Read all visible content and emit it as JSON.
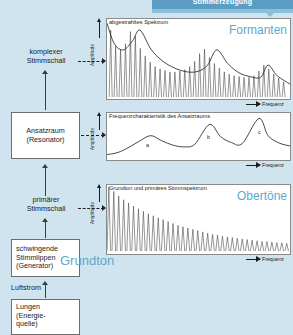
{
  "banner": {
    "title": "Stimmerzeugung"
  },
  "flow": {
    "boxes": [
      {
        "name": "ansatzraum",
        "lines": [
          "Ansatzraum",
          "(Resonator)"
        ]
      },
      {
        "name": "stimmlippen",
        "lines": [
          "schwingende",
          "Stimmlippen",
          "(Generator)"
        ]
      },
      {
        "name": "lungen",
        "lines": [
          "Lungen",
          "(Energie-",
          "quelle)"
        ]
      }
    ],
    "labels": [
      {
        "name": "komplexer-stimmschall",
        "lines": [
          "komplexer",
          "Stimmschall"
        ]
      },
      {
        "name": "primaerer-stimmschall",
        "lines": [
          "primärer",
          "Stimmschall"
        ]
      },
      {
        "name": "luftstrom",
        "lines": [
          "Luftstrom"
        ]
      }
    ]
  },
  "keywords": {
    "formanten": "Formanten",
    "obertoene": "Obertöne",
    "grundton": "Grundton"
  },
  "axes": {
    "amplitude": "Amplitude",
    "frequenz": "Frequenz"
  },
  "colors": {
    "background": "#cfe4ee",
    "banner": "#5b9dc4",
    "accent_text": "#5fa8cc",
    "chart_bg": "#ffffff",
    "line": "#3c3c3c"
  },
  "chart_data": [
    {
      "type": "line",
      "name": "abgestrahltes-spektrum",
      "title": "abgestrahltes Spektrum",
      "keyword": "Formanten",
      "xlabel": "Frequenz",
      "ylabel": "Amplitude",
      "grid": false,
      "legend": "none",
      "xlim": [
        0,
        1
      ],
      "ylim": [
        0,
        1
      ],
      "description": "Harmonic line spectrum whose peak amplitudes follow a formant envelope with three resonance maxima.",
      "envelope_x": [
        0.0,
        0.04,
        0.09,
        0.14,
        0.18,
        0.24,
        0.3,
        0.37,
        0.44,
        0.5,
        0.55,
        0.6,
        0.66,
        0.72,
        0.78,
        0.84,
        0.88,
        0.93,
        1.0
      ],
      "envelope_y": [
        0.97,
        0.7,
        0.62,
        0.74,
        0.88,
        0.63,
        0.48,
        0.38,
        0.33,
        0.34,
        0.42,
        0.62,
        0.44,
        0.32,
        0.27,
        0.26,
        0.42,
        0.28,
        0.17
      ],
      "harmonics_x": [
        0.02,
        0.047,
        0.074,
        0.101,
        0.128,
        0.155,
        0.182,
        0.209,
        0.236,
        0.263,
        0.29,
        0.317,
        0.344,
        0.371,
        0.398,
        0.425,
        0.452,
        0.479,
        0.506,
        0.533,
        0.56,
        0.587,
        0.614,
        0.641,
        0.668,
        0.695,
        0.722,
        0.749,
        0.776,
        0.803,
        0.83,
        0.857,
        0.884,
        0.911,
        0.938,
        0.965
      ],
      "harmonics_y": [
        0.88,
        0.67,
        0.62,
        0.7,
        0.86,
        0.8,
        0.64,
        0.54,
        0.46,
        0.4,
        0.37,
        0.35,
        0.33,
        0.33,
        0.34,
        0.36,
        0.4,
        0.47,
        0.57,
        0.63,
        0.52,
        0.44,
        0.38,
        0.33,
        0.3,
        0.28,
        0.27,
        0.26,
        0.26,
        0.28,
        0.34,
        0.42,
        0.37,
        0.3,
        0.25,
        0.2
      ]
    },
    {
      "type": "line",
      "name": "frequenzcharakteristik",
      "title": "Frequenzcharakteristik des Ansatzraums",
      "xlabel": "Frequenz",
      "ylabel": "Amplitude",
      "grid": false,
      "legend": "none",
      "xlim": [
        0,
        1
      ],
      "ylim": [
        0,
        1
      ],
      "description": "Transfer function of the vocal tract with three resonance peaks labelled a, b and c.",
      "peak_labels": [
        "a",
        "b",
        "c"
      ],
      "peak_x": [
        0.24,
        0.56,
        0.83
      ],
      "peak_y": [
        0.52,
        0.78,
        0.92
      ],
      "curve_x": [
        0.0,
        0.06,
        0.12,
        0.18,
        0.24,
        0.3,
        0.36,
        0.42,
        0.48,
        0.56,
        0.62,
        0.68,
        0.74,
        0.83,
        0.88,
        0.94,
        1.0
      ],
      "curve_y": [
        0.08,
        0.13,
        0.25,
        0.4,
        0.52,
        0.4,
        0.3,
        0.26,
        0.32,
        0.78,
        0.5,
        0.36,
        0.34,
        0.92,
        0.52,
        0.35,
        0.28
      ]
    },
    {
      "type": "line",
      "name": "primaeres-stimmspektrum",
      "title": "Grundton und primäres Stimmspektrum",
      "keyword": "Obertöne",
      "xlabel": "Frequenz",
      "ylabel": "Amplitude",
      "grid": false,
      "legend": "none",
      "xlim": [
        0,
        1
      ],
      "ylim": [
        0,
        1
      ],
      "description": "Fundamental plus overtone series with monotonically decaying amplitudes.",
      "harmonics_x": [
        0.01,
        0.037,
        0.064,
        0.091,
        0.118,
        0.145,
        0.172,
        0.199,
        0.226,
        0.253,
        0.28,
        0.307,
        0.334,
        0.361,
        0.388,
        0.415,
        0.442,
        0.469,
        0.496,
        0.523,
        0.55,
        0.577,
        0.604,
        0.631,
        0.658,
        0.685,
        0.712,
        0.739,
        0.766,
        0.793,
        0.82,
        0.847,
        0.874,
        0.901,
        0.928,
        0.955,
        0.982
      ],
      "harmonics_y": [
        1.0,
        0.93,
        0.86,
        0.8,
        0.75,
        0.7,
        0.66,
        0.62,
        0.58,
        0.55,
        0.52,
        0.49,
        0.46,
        0.43,
        0.4,
        0.38,
        0.36,
        0.34,
        0.32,
        0.3,
        0.28,
        0.26,
        0.25,
        0.23,
        0.22,
        0.21,
        0.2,
        0.19,
        0.18,
        0.17,
        0.16,
        0.15,
        0.15,
        0.14,
        0.13,
        0.13,
        0.12
      ]
    }
  ]
}
